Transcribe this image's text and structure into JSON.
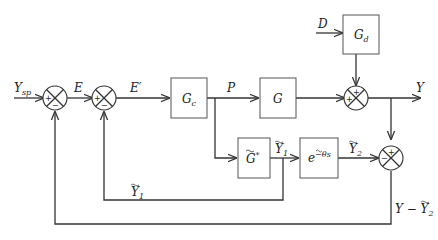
{
  "diagram": {
    "title": "",
    "type": "block-diagram",
    "blocks": [
      {
        "id": "Gc",
        "label": "G",
        "sub": "c"
      },
      {
        "id": "G",
        "label": "G",
        "sub": ""
      },
      {
        "id": "Gd",
        "label": "G",
        "sub": "d"
      },
      {
        "id": "Gstar",
        "label": "G̃*",
        "sub": ""
      },
      {
        "id": "delay",
        "label": "e",
        "sup": "−θ̃s"
      }
    ],
    "signals": {
      "ysp": {
        "main": "Y",
        "sub": "sp"
      },
      "e": "E",
      "eprime": "E′",
      "p": "P",
      "d": "D",
      "y": "Y",
      "y1_tilde_top": {
        "main": "Ỹ",
        "sub": "1"
      },
      "y2_tilde": {
        "main": "Ỹ",
        "sub": "2"
      },
      "y1_tilde_feedback": {
        "main": "Ỹ",
        "sub": "1"
      },
      "y_minus_y2": {
        "main": "Y − Ỹ",
        "sub": "2"
      }
    },
    "summing_junctions": [
      {
        "id": "sum1",
        "signs": {
          "left": "+",
          "bottom": "−"
        }
      },
      {
        "id": "sum2",
        "signs": {
          "left": "+",
          "bottom": "−"
        }
      },
      {
        "id": "sum3",
        "signs": {
          "top": "+",
          "left": "+"
        }
      },
      {
        "id": "sum4",
        "signs": {
          "top": "+",
          "left": "−"
        }
      }
    ]
  }
}
